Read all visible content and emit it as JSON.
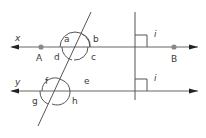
{
  "diagram": {
    "lines": {
      "x": {
        "label": "x"
      },
      "y": {
        "label": "y"
      }
    },
    "points": {
      "A": {
        "label": "A"
      },
      "B": {
        "label": "B"
      }
    },
    "angles": {
      "a": "a",
      "b": "b",
      "c": "c",
      "d": "d",
      "e": "e",
      "f": "f",
      "g": "g",
      "h": "h"
    },
    "right_angles": {
      "upper": "i",
      "lower": "i"
    },
    "colors": {
      "line": "#555555",
      "point": "#888888",
      "text": "#3a3a3a"
    }
  }
}
